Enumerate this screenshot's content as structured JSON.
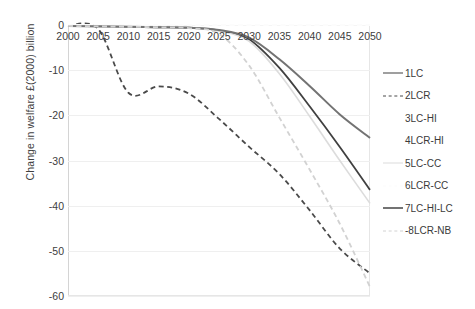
{
  "chart_data": {
    "type": "line",
    "title": "",
    "xlabel": "",
    "ylabel": "Change in welfare £(2000) billion",
    "x": [
      2000,
      2005,
      2010,
      2015,
      2020,
      2025,
      2030,
      2035,
      2040,
      2045,
      2050
    ],
    "xticklabels": [
      "2000",
      "2005",
      "2010",
      "2015",
      "2020",
      "2025",
      "2030",
      "2035",
      "2040",
      "2045",
      "2050"
    ],
    "yticklabels": [
      "0",
      "-10",
      "-20",
      "-30",
      "-40",
      "-50",
      "-60"
    ],
    "yticks": [
      0,
      -10,
      -20,
      -30,
      -40,
      -50,
      -60
    ],
    "xlim": [
      2000,
      2050
    ],
    "ylim": [
      -60,
      0
    ],
    "grid": false,
    "legend_position": "right",
    "series": [
      {
        "name": "1LC",
        "style": "solid",
        "color": "#404040",
        "width": 1.8,
        "values": [
          -0.2,
          -0.3,
          -0.4,
          -0.5,
          -0.6,
          -1.2,
          -3.2,
          -9.5,
          -18.0,
          -27.0,
          -36.5
        ]
      },
      {
        "name": "2LCR",
        "style": "dashed",
        "color": "#4a4a4a",
        "width": 1.8,
        "values": [
          -0.2,
          -0.9,
          -15.0,
          -13.6,
          -15.2,
          -20.8,
          -27.0,
          -33.0,
          -41.0,
          -49.5,
          -55.0
        ]
      },
      {
        "name": "3LC-HI",
        "style": "solid",
        "color": "#ffffff",
        "width": 1.4,
        "values": [
          0,
          0,
          0,
          0,
          0,
          0,
          0,
          0,
          0,
          0,
          0
        ]
      },
      {
        "name": "4LCR-HI",
        "style": "dashed",
        "color": "#ffffff",
        "width": 1.4,
        "values": [
          0,
          0,
          0,
          0,
          0,
          0,
          0,
          0,
          0,
          0,
          0
        ]
      },
      {
        "name": "5LC-CC",
        "style": "solid",
        "color": "#dcdcdc",
        "width": 1.6,
        "values": [
          -0.2,
          -0.3,
          -0.4,
          -0.5,
          -0.6,
          -1.3,
          -3.6,
          -10.8,
          -20.2,
          -30.0,
          -39.5
        ]
      },
      {
        "name": "6LCR-CC",
        "style": "dashed",
        "color": "#fbfbfb",
        "width": 1.4,
        "values": [
          0,
          0,
          0,
          0,
          0,
          0,
          0,
          0,
          0,
          0,
          0
        ]
      },
      {
        "name": "7LC-HI-LC",
        "style": "solid",
        "color": "#737373",
        "width": 2.0,
        "values": [
          -0.2,
          -0.3,
          -0.4,
          -0.5,
          -0.6,
          -1.1,
          -2.8,
          -7.6,
          -13.5,
          -19.8,
          -25.0
        ]
      },
      {
        "name": "-8LCR-NB",
        "style": "dashed",
        "color": "#d2d2d2",
        "width": 1.8,
        "values": [
          -0.2,
          -0.3,
          -0.4,
          -0.5,
          -0.7,
          -2.0,
          -9.0,
          -20.5,
          -32.0,
          -44.0,
          -58.0
        ]
      }
    ]
  }
}
